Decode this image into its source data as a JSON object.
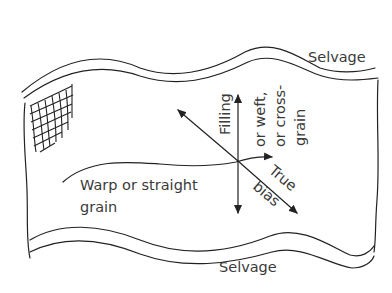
{
  "diagram": {
    "labels": {
      "selvage_top": "Selvage",
      "selvage_bottom": "Selvage",
      "filling_line1": "Filling",
      "filling_line2": "or weft,",
      "filling_line3": "or cross-",
      "filling_line4": "grain",
      "warp_line1": "Warp or straight",
      "warp_line2": "grain",
      "bias_line1": "True",
      "bias_line2": "bias"
    },
    "colors": {
      "line": "#222222",
      "text": "#3a3a3a",
      "background": "#ffffff"
    }
  }
}
